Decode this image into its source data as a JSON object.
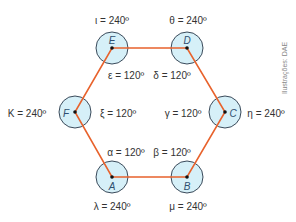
{
  "colors": {
    "circle_fill": "#d6f0f8",
    "circle_stroke": "#3a4a5a",
    "edge": "#e8622c",
    "dot": "#111111",
    "text": "#333333",
    "credit": "#888888"
  },
  "vertices": [
    {
      "id": "E",
      "label": "E",
      "x": 112,
      "y": 48
    },
    {
      "id": "D",
      "label": "D",
      "x": 187,
      "y": 48
    },
    {
      "id": "C",
      "label": "C",
      "x": 225,
      "y": 112
    },
    {
      "id": "B",
      "label": "B",
      "x": 187,
      "y": 177
    },
    {
      "id": "A",
      "label": "A",
      "x": 112,
      "y": 177
    },
    {
      "id": "F",
      "label": "F",
      "x": 75,
      "y": 112
    }
  ],
  "angles": {
    "iota": "ι = 240º",
    "theta": "θ = 240º",
    "epsilon": "ε = 120º",
    "delta": "δ = 120º",
    "kappa": "K = 240º",
    "xi": "ξ = 120º",
    "gamma": "γ = 120º",
    "eta": "η = 240º",
    "alpha": "α = 120º",
    "beta": "β = 120º",
    "lambda": "λ = 240º",
    "mu": "μ = 240º"
  },
  "credit": "Ilustrações: DAE"
}
